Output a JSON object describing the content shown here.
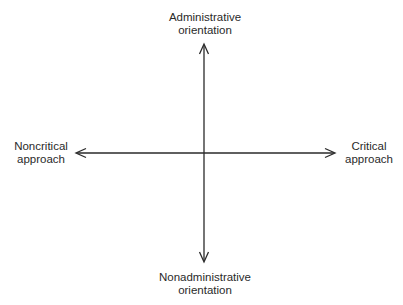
{
  "diagram": {
    "type": "two-axis quadrant diagram",
    "axes": {
      "vertical": {
        "top_label": [
          "Administrative",
          "orientation"
        ],
        "bottom_label": [
          "Nonadministrative",
          "orientation"
        ]
      },
      "horizontal": {
        "left_label": [
          "Noncritical",
          "approach"
        ],
        "right_label": [
          "Critical",
          "approach"
        ]
      }
    },
    "colors": {
      "line": "#2a2a2a",
      "text": "#2a2a2a",
      "background": "#ffffff"
    }
  }
}
